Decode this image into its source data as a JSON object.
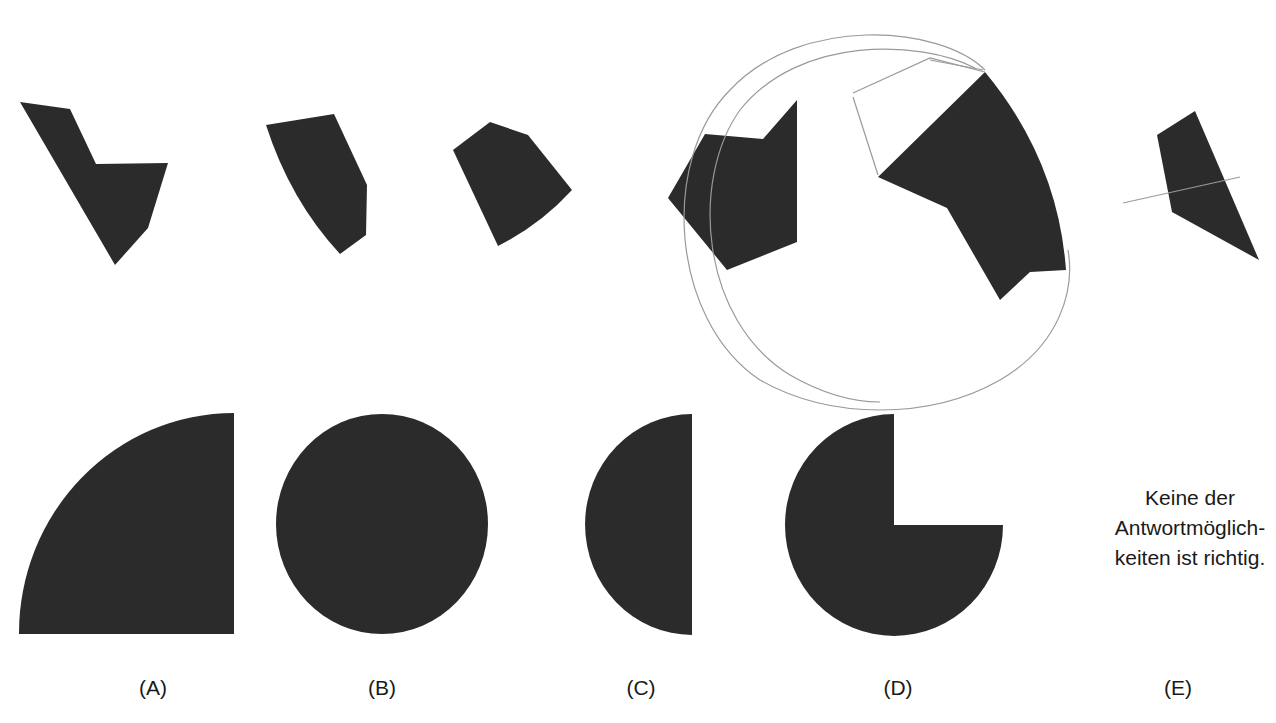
{
  "puzzle": {
    "type": "figure assembly task",
    "pieces_row": {
      "piece_count": 6,
      "pieces": [
        {
          "id": 1,
          "shape": "irregular hexagon with notch"
        },
        {
          "id": 2,
          "shape": "pentagon with curved left edge"
        },
        {
          "id": 3,
          "shape": "pentagon with curved bottom-right edge"
        },
        {
          "id": 4,
          "shape": "hexagon with notch at top"
        },
        {
          "id": 5,
          "shape": "sector-like piece with curved right edge"
        },
        {
          "id": 6,
          "shape": "quadrilateral"
        }
      ],
      "pencil_annotations": "hand-drawn circle sketches around pieces 4 and 5, stray line through piece 6"
    },
    "fill_color": "#2b2b2b",
    "pencil_color": "#9a9a9a",
    "background_color": "#ffffff"
  },
  "answers": [
    {
      "label": "(A)",
      "shape": "quarter circle"
    },
    {
      "label": "(B)",
      "shape": "full circle"
    },
    {
      "label": "(C)",
      "shape": "semicircle"
    },
    {
      "label": "(D)",
      "shape": "three-quarter circle"
    },
    {
      "label": "(E)",
      "shape": "text option",
      "text_lines": [
        "Keine der",
        "Antwortmöglich-",
        "keiten ist richtig."
      ]
    }
  ]
}
